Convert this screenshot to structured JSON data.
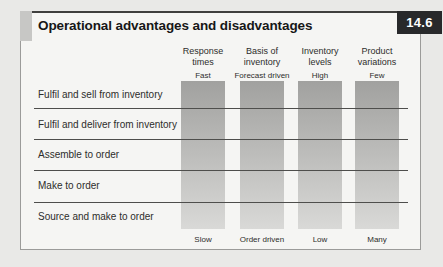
{
  "figure": {
    "number": "14.6",
    "title": "Operational advantages and disadvantages"
  },
  "columns": [
    {
      "header_line1": "Response",
      "header_line2": "times",
      "top_label": "Fast",
      "bottom_label": "Slow"
    },
    {
      "header_line1": "Basis of",
      "header_line2": "inventory",
      "top_label": "Forecast driven",
      "bottom_label": "Order driven"
    },
    {
      "header_line1": "Inventory",
      "header_line2": "levels",
      "top_label": "High",
      "bottom_label": "Low"
    },
    {
      "header_line1": "Product",
      "header_line2": "variations",
      "top_label": "Few",
      "bottom_label": "Many"
    }
  ],
  "rows": [
    {
      "label": "Fulfil and sell from inventory"
    },
    {
      "label": "Fulfil and deliver from inventory"
    },
    {
      "label": "Assemble to order"
    },
    {
      "label": "Make to order"
    },
    {
      "label": "Source and make to order"
    }
  ],
  "colors": {
    "page_bg": "#e9e9e7",
    "panel_bg": "#f5f5f3",
    "badge_bg": "#28292b",
    "badge_text": "#ffffff",
    "bar_top": "#a1a19f",
    "bar_bottom": "#d9d9d7",
    "divider": "#4e4e4c",
    "text": "#2d2d2b"
  }
}
